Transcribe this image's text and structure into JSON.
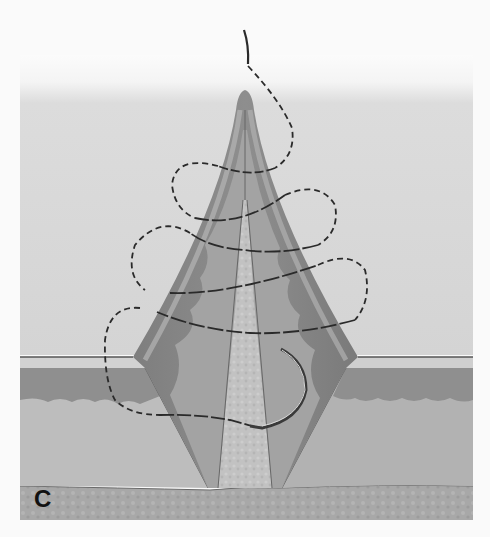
{
  "figure": {
    "panel_label": "C",
    "elements": {
      "suture_thread": "suture-thread",
      "needle": "curved-needle",
      "flap": "tissue-flap",
      "skin_layers": [
        "epidermis",
        "dermis",
        "subcutaneous",
        "deep-fascia"
      ]
    },
    "colors": {
      "background_top": "#f7f7f7",
      "background_field": "#d6d6d6",
      "skin_surface": "#dcdcdc",
      "epidermis_band": "#cfcfcf",
      "dermis_dark": "#8f8f8f",
      "subcutaneous": "#b9b9b9",
      "deep_layer": "#a9a9a9",
      "flap_outer": "#8a8a8a",
      "flap_mid": "#9c9c9c",
      "flap_core": "#c4c4c4",
      "suture": "#2a2a2a",
      "label": "#111111"
    }
  }
}
